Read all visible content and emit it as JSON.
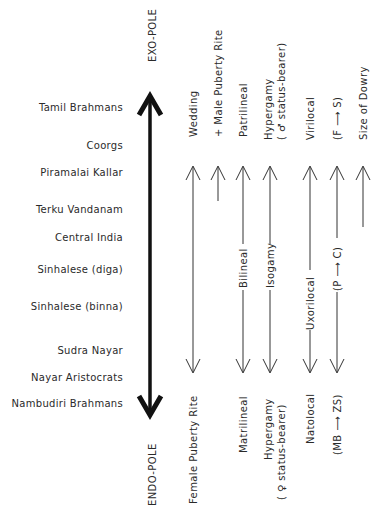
{
  "diagram": {
    "poles": {
      "top": "EXO-POLE",
      "bottom": "ENDO-POLE"
    },
    "groups": [
      "Tamil Brahmans",
      "Coorgs",
      "Piramalai Kallar",
      "Terku Vandanam",
      "Central India",
      "Sinhalese (diga)",
      "Sinhalese (binna)",
      "Sudra Nayar",
      "Nayar Aristocrats",
      "Nambudiri Brahmans"
    ],
    "columns": [
      {
        "top": "Wedding",
        "top2": "",
        "middle": "",
        "bottom": "Female Puberty Rite",
        "bottom2": ""
      },
      {
        "top": "+ Male Puberty Rite",
        "top2": "",
        "middle": "",
        "bottom": "",
        "bottom2": ""
      },
      {
        "top": "Patrilineal",
        "top2": "",
        "middle": "Bilineal",
        "bottom": "Matrilineal",
        "bottom2": ""
      },
      {
        "top": "Hypergamy",
        "top2": "( ♂ status-bearer)",
        "middle": "Isogamy",
        "bottom": "Hypergamy",
        "bottom2": "( ♀ status-bearer)"
      },
      {
        "top": "Virilocal",
        "top2": "",
        "middle": "Uxorilocal",
        "bottom": "Natolocal",
        "bottom2": ""
      },
      {
        "top": "(F ⟶ S)",
        "top2": "",
        "middle": "(P ⟶ C)",
        "bottom": "(MB ⟶ ZS)",
        "bottom2": ""
      },
      {
        "top": "Size of Dowry",
        "top2": "",
        "middle": "",
        "bottom": "",
        "bottom2": ""
      }
    ]
  }
}
